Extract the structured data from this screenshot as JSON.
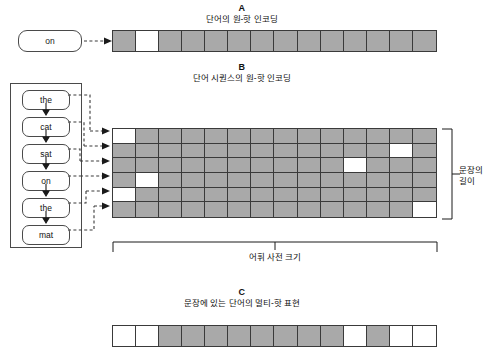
{
  "figure": {
    "colors": {
      "cell_on": "#ffffff",
      "cell_off": "#a9a9a9",
      "stroke": "#3a3a3a",
      "background": "#ffffff"
    }
  },
  "section_a": {
    "letter": "A",
    "subtitle": "단어의 원-핫 인코딩",
    "word": "on",
    "vector_length": 14,
    "hot_index": 1,
    "cells": [
      0,
      1,
      0,
      0,
      0,
      0,
      0,
      0,
      0,
      0,
      0,
      0,
      0,
      0
    ]
  },
  "section_b": {
    "letter": "B",
    "subtitle": "단어 시퀀스의 원-핫 인코딩",
    "words": [
      "the",
      "cat",
      "sat",
      "on",
      "the",
      "mat"
    ],
    "rows": 6,
    "cols": 14,
    "hot_indices": [
      0,
      12,
      10,
      1,
      0,
      13
    ],
    "matrix": [
      [
        1,
        0,
        0,
        0,
        0,
        0,
        0,
        0,
        0,
        0,
        0,
        0,
        0,
        0
      ],
      [
        0,
        0,
        0,
        0,
        0,
        0,
        0,
        0,
        0,
        0,
        0,
        0,
        1,
        0
      ],
      [
        0,
        0,
        0,
        0,
        0,
        0,
        0,
        0,
        0,
        0,
        1,
        0,
        0,
        0
      ],
      [
        0,
        1,
        0,
        0,
        0,
        0,
        0,
        0,
        0,
        0,
        0,
        0,
        0,
        0
      ],
      [
        1,
        0,
        0,
        0,
        0,
        0,
        0,
        0,
        0,
        0,
        0,
        0,
        0,
        0
      ],
      [
        0,
        0,
        0,
        0,
        0,
        0,
        0,
        0,
        0,
        0,
        0,
        0,
        0,
        1
      ]
    ],
    "bracket_bottom_label": "어휘 사전 크기",
    "bracket_right_label_line1": "문장의",
    "bracket_right_label_line2": "길이"
  },
  "section_c": {
    "letter": "C",
    "subtitle": "문장에 있는 단어의 멀티-핫 표현",
    "vector_length": 14,
    "cells": [
      1,
      1,
      0,
      0,
      0,
      0,
      0,
      0,
      0,
      0,
      1,
      0,
      1,
      1
    ]
  }
}
